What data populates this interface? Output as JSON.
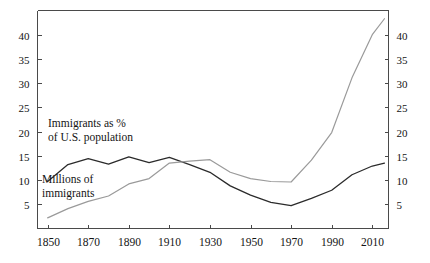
{
  "chart_data": {
    "type": "line",
    "title": "",
    "subtitle": "",
    "xlabel": "",
    "ylabel": "",
    "xlim": [
      1845,
      2018
    ],
    "ylim": [
      0,
      45
    ],
    "grid": false,
    "legend_position": "inline-annotation",
    "x_ticks": [
      1850,
      1870,
      1890,
      1910,
      1930,
      1950,
      1970,
      1990,
      2010
    ],
    "x_tick_labels": [
      "1850",
      "1870",
      "1890",
      "1910",
      "1930",
      "1950",
      "1970",
      "1990",
      "2010"
    ],
    "y_ticks": [
      5,
      10,
      15,
      20,
      25,
      30,
      35,
      40
    ],
    "y_tick_labels_left": [
      "5",
      "10",
      "15",
      "20",
      "25",
      "30",
      "35",
      "40"
    ],
    "y_tick_labels_right": [
      "5",
      "10",
      "15",
      "20",
      "25",
      "30",
      "35",
      "40"
    ],
    "series": [
      {
        "name": "Immigrants as % of U.S. population",
        "annotation_lines": [
          "Immigrants as %",
          "of U.S. population"
        ],
        "color": "#2b2b2b",
        "x": [
          1850,
          1860,
          1870,
          1880,
          1890,
          1900,
          1910,
          1920,
          1930,
          1940,
          1950,
          1960,
          1970,
          1980,
          1990,
          2000,
          2010,
          2016
        ],
        "values": [
          9.7,
          13.2,
          14.4,
          13.3,
          14.8,
          13.6,
          14.7,
          13.2,
          11.6,
          8.8,
          6.9,
          5.4,
          4.7,
          6.2,
          7.9,
          11.1,
          12.9,
          13.5
        ]
      },
      {
        "name": "Millions of immigrants",
        "annotation_lines": [
          "Millions of",
          "immigrants"
        ],
        "color": "#9a9a9a",
        "x": [
          1850,
          1860,
          1870,
          1880,
          1890,
          1900,
          1910,
          1920,
          1930,
          1940,
          1950,
          1960,
          1970,
          1980,
          1990,
          2000,
          2010,
          2016
        ],
        "values": [
          2.2,
          4.1,
          5.6,
          6.7,
          9.2,
          10.3,
          13.5,
          13.9,
          14.2,
          11.6,
          10.3,
          9.7,
          9.6,
          14.1,
          19.8,
          31.1,
          40.0,
          43.3
        ]
      }
    ]
  }
}
